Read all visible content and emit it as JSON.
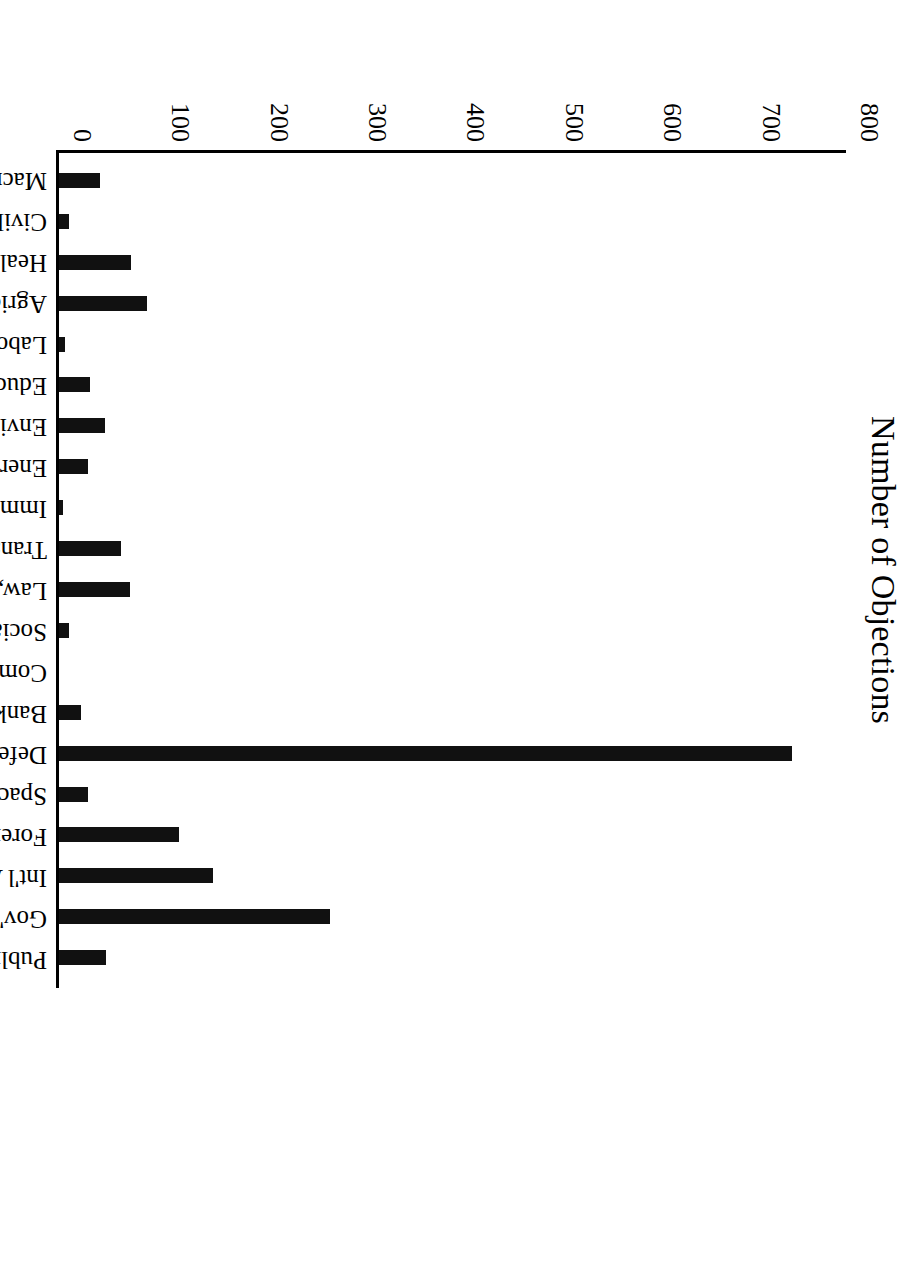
{
  "chart_data": {
    "type": "bar",
    "title": "",
    "orientation": "rotated-90",
    "xlabel": "Policy Area",
    "ylabel": "Number of Objections",
    "ylim": [
      0,
      800
    ],
    "ytick_labels": [
      "0",
      "100",
      "200",
      "300",
      "400",
      "500",
      "600",
      "700",
      "800"
    ],
    "ytick_values": [
      0,
      100,
      200,
      300,
      400,
      500,
      600,
      700,
      800
    ],
    "grid": false,
    "legend": "none",
    "bar_color": "#111111",
    "categories": [
      "Macroeconomics",
      "Civil Rights & Liberties",
      "Health",
      "Agriculture",
      "Labor and Employment",
      "Education",
      "Environment",
      "Energy",
      "Immigration",
      "Transportation",
      "Law, Crime, & Family Issues",
      "Social Welfare",
      "Community Development & Housing",
      "Banking, Finance, and Dom. Commerce",
      "Defense",
      "Space, Science, Technology",
      "Foreign Trade",
      "Int'l Affairs & Foreign Aid",
      "Gov't Operations",
      "Public Lands"
    ],
    "values": [
      42,
      10,
      73,
      89,
      6,
      32,
      47,
      29,
      4,
      63,
      72,
      10,
      0,
      22,
      745,
      30,
      122,
      157,
      276,
      48
    ]
  },
  "axis": {
    "value_axis_title": "Number of Objections",
    "category_axis_title": "Policy Area"
  }
}
